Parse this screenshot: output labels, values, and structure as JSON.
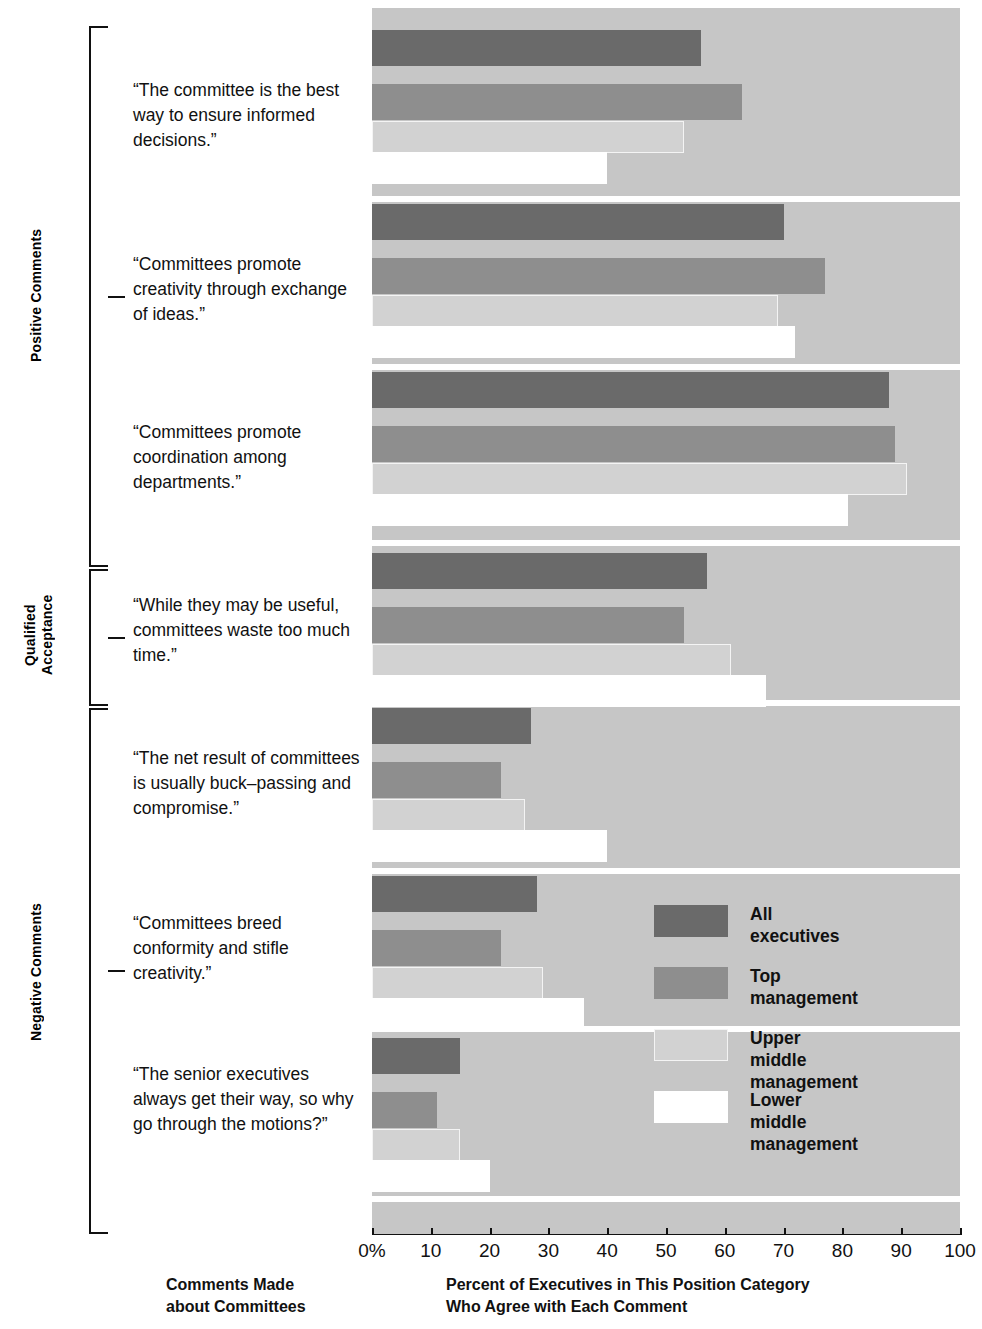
{
  "chart_data": {
    "type": "bar",
    "orientation": "horizontal",
    "title": "",
    "xlabel": "Percent of Executives in This Position Category\nWho Agree with Each Comment",
    "ylabel": "Comments Made\nabout Committees",
    "xlim": [
      0,
      100
    ],
    "xticks": [
      0,
      10,
      20,
      30,
      40,
      50,
      60,
      70,
      80,
      90,
      100
    ],
    "xticklabels": [
      "0%",
      "10",
      "20",
      "30",
      "40",
      "50",
      "60",
      "70",
      "80",
      "90",
      "100"
    ],
    "grid": false,
    "legend_position": "inner-right",
    "series": [
      {
        "name": "All executives",
        "color": "#6a6a6a",
        "values": [
          56,
          70,
          88,
          57,
          27,
          28,
          15
        ]
      },
      {
        "name": "Top management",
        "color": "#8e8e8e",
        "values": [
          63,
          77,
          89,
          53,
          22,
          22,
          11
        ]
      },
      {
        "name": "Upper middle management",
        "color": "#d2d2d2",
        "values": [
          53,
          69,
          91,
          61,
          26,
          29,
          15
        ]
      },
      {
        "name": "Lower middle management",
        "color": "#ffffff",
        "values": [
          40,
          72,
          81,
          67,
          40,
          36,
          20
        ]
      }
    ],
    "categories": [
      "“The committee is the best way to ensure informed decisions.”",
      "“Committees promote creativity through exchange of ideas.”",
      "“Committees promote coordination among departments.”",
      "“While they may be useful, committees waste too much time.”",
      "“The net result of committees is usually buck–passing and compromise.”",
      "“Committees breed conformity and stifle creativity.”",
      "“The senior executives always get their way, so why go through the motions?”"
    ],
    "category_groups": [
      {
        "label": "Positive Comments",
        "categories": [
          0,
          1,
          2
        ]
      },
      {
        "label": "Qualified\nAcceptance",
        "categories": [
          3
        ]
      },
      {
        "label": "Negative Comments",
        "categories": [
          4,
          5,
          6
        ]
      }
    ]
  },
  "comments": [
    "“The committee is the\nbest way to ensure\ninformed decisions.”",
    "“Committees promote\ncreativity through\nexchange of ideas.”",
    "“Committees\npromote coordination\namong departments.”",
    "“While they may be\nuseful, committees\nwaste too much time.”",
    "“The net result\nof committees is\nusually buck–passing\nand compromise.”",
    "“Committees\nbreed conformity\nand  stifle creativity.”",
    "“The senior\nexecutives always get\ntheir way, so why go\nthrough the motions?”"
  ],
  "groups": [
    {
      "label": "Positive Comments"
    },
    {
      "label": "Qualified\nAcceptance"
    },
    {
      "label": "Negative Comments"
    }
  ],
  "legend": {
    "items": [
      {
        "label": "All executives",
        "color": "#6a6a6a"
      },
      {
        "label": "Top management",
        "color": "#8e8e8e"
      },
      {
        "label": "Upper middle\nmanagement",
        "color": "#d2d2d2"
      },
      {
        "label": "Lower middle\nmanagement",
        "color": "#ffffff"
      }
    ]
  },
  "axis": {
    "labels": [
      "0%",
      "10",
      "20",
      "30",
      "40",
      "50",
      "60",
      "70",
      "80",
      "90",
      "100"
    ]
  },
  "footers": {
    "left": "Comments Made\nabout Committees",
    "right": "Percent of Executives in This Position Category\nWho Agree with Each Comment"
  }
}
